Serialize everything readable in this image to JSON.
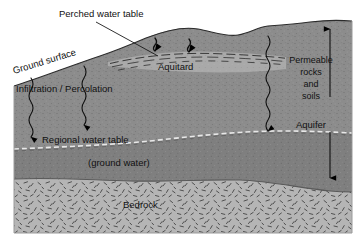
{
  "diagram": {
    "labels": {
      "perched_water_table": "Perched water table",
      "ground_surface": "Ground surface",
      "infiltration_percolation": "Infiltration / Percolation",
      "aquitard": "Aquitard",
      "regional_water_table": "Regional water table",
      "ground_water": "(ground water)",
      "bedrock": "Bedrock",
      "permeable_line1": "Permeable",
      "permeable_line2": "rocks",
      "permeable_line3": "and",
      "permeable_line4": "soils",
      "aquifer": "Aquifer"
    },
    "colors": {
      "background": "#ffffff",
      "soil_fill": "#8c8c8c",
      "bedrock_fill": "#b4b4b4",
      "aquitard_fill": "#a8a8a8",
      "saturated_fill": "#828282",
      "line": "#000000",
      "text": "#111111",
      "border": "#9a9a9a"
    },
    "icons": {
      "infiltration_arrow": "wavy-down-arrow-icon",
      "percolation_arrow": "down-arrow-icon",
      "extent_arrow_up": "up-arrow-icon",
      "extent_arrow_down": "down-arrow-icon",
      "leader_line": "leader-line-icon"
    },
    "layers": [
      {
        "name": "permeable rocks and soils",
        "zone": "unsaturated + saturated"
      },
      {
        "name": "aquitard",
        "zone": "perched lens"
      },
      {
        "name": "aquifer",
        "zone": "saturated"
      },
      {
        "name": "bedrock",
        "zone": "impermeable base"
      }
    ]
  }
}
